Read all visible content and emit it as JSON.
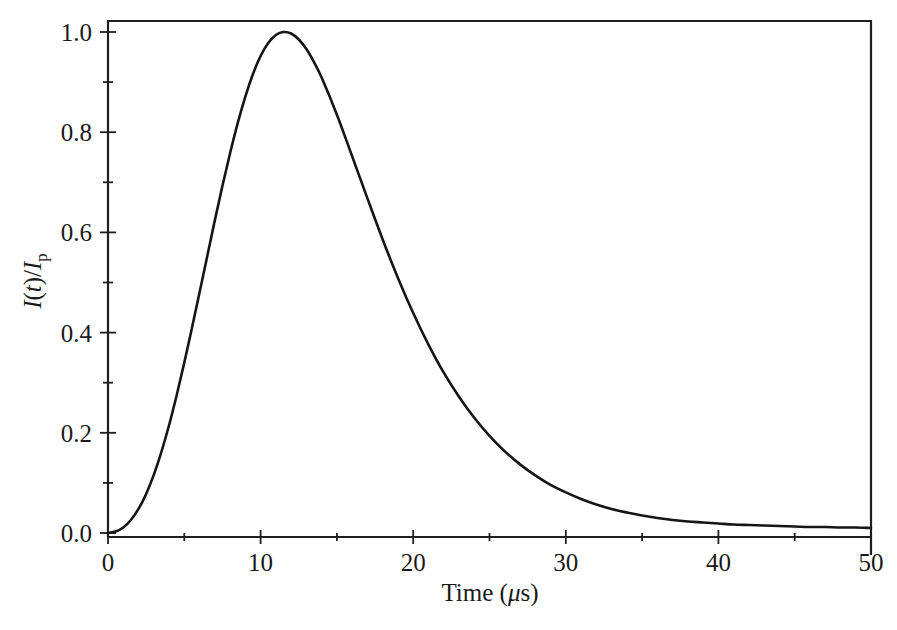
{
  "figure": {
    "background_color": "#ffffff",
    "line_color": "#151515",
    "frame_color": "#1f1f1f",
    "text_color": "#1a1a1a"
  },
  "axes": {
    "x_title_plain": "Time (",
    "x_title_mu": "μ",
    "x_title_tail": "s)",
    "y_title_i": "I",
    "y_title_open": "(",
    "y_title_t": "t",
    "y_title_close": ")/",
    "y_title_i2": "I",
    "y_title_sub": "p",
    "x_ticks": [
      "0",
      "10",
      "20",
      "30",
      "40",
      "50"
    ],
    "y_ticks": [
      "0.0",
      "0.2",
      "0.4",
      "0.6",
      "0.8",
      "1.0"
    ],
    "x_minor_count": 1,
    "y_minor_count": 1,
    "x_range": [
      0,
      50
    ],
    "y_range": [
      0,
      1.0
    ]
  },
  "chart_data": {
    "type": "line",
    "title": "",
    "subtitle": "",
    "xlabel": "Time (μs)",
    "ylabel": "I(t)/I_p",
    "xlim": [
      0,
      50
    ],
    "ylim": [
      0,
      1.0
    ],
    "xticks": [
      0,
      10,
      20,
      30,
      40,
      50
    ],
    "yticks": [
      0.0,
      0.2,
      0.4,
      0.6,
      0.8,
      1.0
    ],
    "grid": false,
    "legend": null,
    "annotations": [],
    "peak": {
      "x": 11.5,
      "y": 1.0
    },
    "series": [
      {
        "name": "Normalized lightning current waveform",
        "x": [
          0,
          0.5,
          1,
          1.5,
          2,
          2.5,
          3,
          3.5,
          4,
          4.5,
          5,
          5.5,
          6,
          6.5,
          7,
          7.5,
          8,
          8.5,
          9,
          9.5,
          10,
          10.5,
          11,
          11.5,
          12,
          12.5,
          13,
          13.5,
          14,
          15,
          16,
          17,
          18,
          19,
          20,
          21,
          22,
          23,
          24,
          25,
          26,
          27,
          28,
          29,
          30,
          31,
          32,
          33,
          34,
          35,
          36,
          37,
          38,
          39,
          40,
          41,
          42,
          43,
          44,
          45,
          46,
          47,
          48,
          49,
          50
        ],
        "y": [
          0.0,
          0.003,
          0.011,
          0.026,
          0.048,
          0.078,
          0.116,
          0.162,
          0.215,
          0.275,
          0.34,
          0.409,
          0.48,
          0.552,
          0.624,
          0.693,
          0.758,
          0.818,
          0.871,
          0.916,
          0.952,
          0.978,
          0.994,
          1.0,
          0.997,
          0.985,
          0.966,
          0.94,
          0.909,
          0.835,
          0.752,
          0.668,
          0.586,
          0.509,
          0.439,
          0.376,
          0.32,
          0.272,
          0.23,
          0.194,
          0.163,
          0.137,
          0.115,
          0.096,
          0.081,
          0.068,
          0.057,
          0.048,
          0.041,
          0.035,
          0.03,
          0.026,
          0.023,
          0.021,
          0.019,
          0.017,
          0.016,
          0.015,
          0.014,
          0.013,
          0.012,
          0.012,
          0.011,
          0.011,
          0.01
        ]
      }
    ]
  }
}
